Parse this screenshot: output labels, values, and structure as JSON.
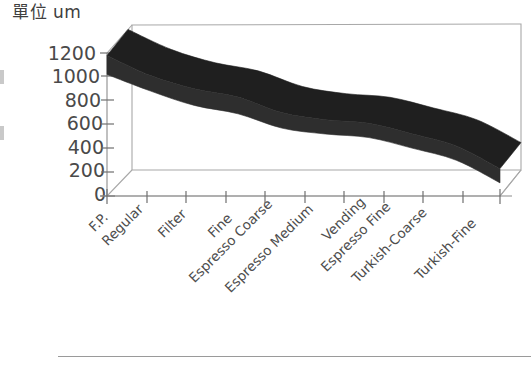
{
  "chart_data": {
    "type": "area",
    "title": "單位 um",
    "xlabel": "",
    "ylabel": "",
    "unit": "um",
    "ylim": [
      0,
      1200
    ],
    "yticks": [
      0,
      200,
      400,
      600,
      800,
      1000,
      1200
    ],
    "grid": false,
    "legend": "none",
    "style": "3d-ribbon",
    "categories": [
      "F.P.",
      "Regular",
      "Filter",
      "Fine",
      "Espresso Coarse",
      "Espresso Medium",
      "Vending",
      "Espresso Fine",
      "Turkish-Coarse",
      "Turkish-Fine"
    ],
    "series": [
      {
        "name": "Upper bound",
        "values": [
          1180,
          1010,
          900,
          830,
          700,
          640,
          610,
          520,
          420,
          230
        ]
      },
      {
        "name": "Lower bound",
        "values": [
          1020,
          880,
          760,
          690,
          570,
          520,
          490,
          400,
          300,
          110
        ]
      }
    ],
    "band_fill": "#2e2e2e"
  },
  "axes": {
    "y_tick_labels": [
      "1200",
      "1000",
      "800",
      "600",
      "400",
      "200",
      "0"
    ],
    "x_tick_labels": [
      "F.P.",
      "Regular",
      "Filter",
      "Fine",
      "Espresso Coarse",
      "Espresso Medium",
      "Vending",
      "Espresso Fine",
      "Turkish-Coarse",
      "Turkish-Fine"
    ]
  },
  "colors": {
    "band": "#2e2e2e",
    "axis": "#8c8c8c",
    "frame": "#a8a8a8",
    "text": "#4a4a4a",
    "rule": "#9a9a9a",
    "background": "#ffffff"
  }
}
